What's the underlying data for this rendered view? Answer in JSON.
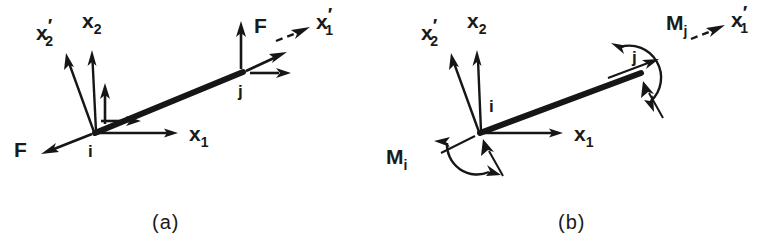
{
  "figure": {
    "background_color": "#ffffff",
    "ink_color": "#161616",
    "width": 777,
    "height": 250
  },
  "panels": [
    {
      "id": "a",
      "caption": "(a)",
      "caption_pos": {
        "x": 152,
        "y": 228
      },
      "description": "Nodal forces F at ends i and j of an inclined beam element",
      "beam": {
        "x1": 95,
        "y1": 133,
        "x2": 243,
        "y2": 72
      },
      "nodes": [
        {
          "name": "i",
          "label": "i",
          "x": 95,
          "y": 133,
          "label_pos": {
            "x": 88,
            "y": 155
          }
        },
        {
          "name": "j",
          "label": "j",
          "x": 243,
          "y": 72,
          "label_pos": {
            "x": 239,
            "y": 96
          }
        }
      ],
      "axes": [
        {
          "name": "x1",
          "label": "x",
          "subscript": "1",
          "prime": false,
          "from": {
            "x": 97,
            "y": 133
          },
          "to": {
            "x": 177,
            "y": 133
          },
          "label_pos": {
            "x": 190,
            "y": 141
          }
        },
        {
          "name": "x2",
          "label": "x",
          "subscript": "2",
          "prime": false,
          "from": {
            "x": 96,
            "y": 131
          },
          "to": {
            "x": 92,
            "y": 52
          },
          "label_pos": {
            "x": 83,
            "y": 26
          }
        },
        {
          "name": "x2-prime",
          "label": "x",
          "subscript": "2",
          "prime": true,
          "from": {
            "x": 94,
            "y": 132
          },
          "to": {
            "x": 67,
            "y": 55
          },
          "label_pos": {
            "x": 38,
            "y": 38
          }
        },
        {
          "name": "x1-prime",
          "label": "x",
          "subscript": "1",
          "prime": true,
          "style": "dashed",
          "from": {
            "x": 278,
            "y": 40
          },
          "to": {
            "x": 308,
            "y": 28
          },
          "label_pos": {
            "x": 318,
            "y": 28
          }
        }
      ],
      "forces": [
        {
          "name": "force-i-global-x1",
          "label": "",
          "from": {
            "x": 101,
            "y": 122
          },
          "to": {
            "x": 140,
            "y": 122
          },
          "kind": "component"
        },
        {
          "name": "force-i-global-x2",
          "label": "",
          "from": {
            "x": 105,
            "y": 125
          },
          "to": {
            "x": 105,
            "y": 84
          },
          "kind": "component"
        },
        {
          "name": "force-i-axial",
          "label": "F",
          "from": {
            "x": 92,
            "y": 134
          },
          "to": {
            "x": 42,
            "y": 154
          },
          "kind": "resultant",
          "label_pos": {
            "x": 16,
            "y": 156
          }
        },
        {
          "name": "force-j-global-x1",
          "label": "",
          "from": {
            "x": 250,
            "y": 73
          },
          "to": {
            "x": 290,
            "y": 73
          },
          "kind": "component"
        },
        {
          "name": "force-j-global-x2",
          "label": "",
          "from": {
            "x": 241,
            "y": 70
          },
          "to": {
            "x": 241,
            "y": 22
          },
          "kind": "component"
        },
        {
          "name": "force-j-axial",
          "label": "F",
          "from": {
            "x": 245,
            "y": 70
          },
          "to": {
            "x": 285,
            "y": 52
          },
          "kind": "resultant",
          "label_pos": {
            "x": 256,
            "y": 32
          }
        }
      ],
      "moments": []
    },
    {
      "id": "b",
      "caption": "(b)",
      "caption_pos": {
        "x": 558,
        "y": 228
      },
      "description": "Nodal moments Mi and Mj at ends i and j of an inclined beam element",
      "beam": {
        "x1": 480,
        "y1": 133,
        "x2": 640,
        "y2": 73
      },
      "nodes": [
        {
          "name": "i",
          "label": "i",
          "x": 480,
          "y": 133,
          "label_pos": {
            "x": 490,
            "y": 110
          }
        },
        {
          "name": "j",
          "label": "j",
          "x": 640,
          "y": 73,
          "label_pos": {
            "x": 633,
            "y": 62
          }
        }
      ],
      "axes": [
        {
          "name": "x1",
          "label": "x",
          "subscript": "1",
          "prime": false,
          "from": {
            "x": 482,
            "y": 133
          },
          "to": {
            "x": 562,
            "y": 133
          },
          "label_pos": {
            "x": 574,
            "y": 141
          }
        },
        {
          "name": "x2",
          "label": "x",
          "subscript": "2",
          "prime": false,
          "from": {
            "x": 481,
            "y": 131
          },
          "to": {
            "x": 478,
            "y": 52
          },
          "label_pos": {
            "x": 468,
            "y": 26
          }
        },
        {
          "name": "x2-prime",
          "label": "x",
          "subscript": "2",
          "prime": true,
          "from": {
            "x": 479,
            "y": 132
          },
          "to": {
            "x": 452,
            "y": 55
          },
          "label_pos": {
            "x": 423,
            "y": 38
          }
        },
        {
          "name": "x1-prime",
          "label": "x",
          "subscript": "1",
          "prime": true,
          "style": "dashed",
          "from": {
            "x": 693,
            "y": 38
          },
          "to": {
            "x": 723,
            "y": 26
          },
          "label_pos": {
            "x": 733,
            "y": 26
          }
        }
      ],
      "forces": [
        {
          "name": "rotation-indicator-i",
          "label": "",
          "from": {
            "x": 500,
            "y": 170
          },
          "to": {
            "x": 482,
            "y": 138
          },
          "kind": "component"
        },
        {
          "name": "rotation-indicator-j",
          "label": "",
          "from": {
            "x": 660,
            "y": 112
          },
          "to": {
            "x": 641,
            "y": 80
          },
          "kind": "component"
        }
      ],
      "moments": [
        {
          "name": "moment-i",
          "label": "M",
          "subscript": "i",
          "label_pos": {
            "x": 388,
            "y": 162
          },
          "center": {
            "x": 472,
            "y": 148
          },
          "radius": 26,
          "start_angle": 170,
          "end_angle": 62
        },
        {
          "name": "moment-j",
          "label": "M",
          "subscript": "j",
          "label_pos": {
            "x": 669,
            "y": 28
          },
          "center": {
            "x": 632,
            "y": 58
          },
          "radius": 26,
          "start_angle": 300,
          "end_angle": 60
        }
      ]
    }
  ]
}
